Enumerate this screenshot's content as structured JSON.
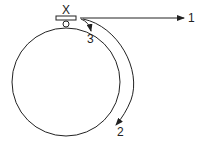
{
  "diagram": {
    "labels": {
      "x": "X",
      "arrow1": "1",
      "arrow2": "2",
      "arrow3": "3"
    },
    "colors": {
      "stroke": "#222222",
      "background": "#ffffff"
    },
    "elements": {
      "big_circle": {
        "cx": 66,
        "cy": 82,
        "r": 54
      },
      "small_circle": {
        "cx": 66,
        "cy": 24,
        "r": 3
      },
      "block": {
        "x": 56,
        "y": 16,
        "width": 20,
        "height": 4
      }
    },
    "arrows": [
      {
        "id": "1",
        "description": "straight horizontal arrow to the right (tangent)"
      },
      {
        "id": "2",
        "description": "long arc following the circle downward"
      },
      {
        "id": "3",
        "description": "short curved arrow inward toward the circle"
      }
    ]
  }
}
